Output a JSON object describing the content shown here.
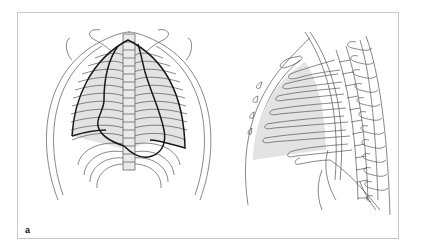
{
  "figure": {
    "panel_label": "a",
    "views": [
      {
        "id": "frontal",
        "description": "Frontal (anterior) chest view with ribs, spine and shaded lung/heart outline"
      },
      {
        "id": "lateral",
        "description": "Lateral chest view with ribs, vertebral column and shaded lung region"
      }
    ],
    "colors": {
      "frame_border": "#c8c8c8",
      "line": "#555555",
      "outline": "#1a1a1a",
      "shading": "#e3e3e3",
      "background": "#ffffff"
    }
  }
}
